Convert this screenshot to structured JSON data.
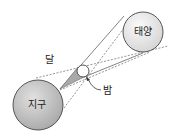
{
  "diagram": {
    "labels": {
      "sun": "태양",
      "earth": "지구",
      "moon": "달",
      "night": "밤"
    },
    "colors": {
      "earth_fill": "#c8c8c8",
      "sun_fill": "#e8e8e8",
      "moon_fill": "#ffffff",
      "shadow_cone": "#a9a9a9",
      "line": "#555555"
    }
  }
}
